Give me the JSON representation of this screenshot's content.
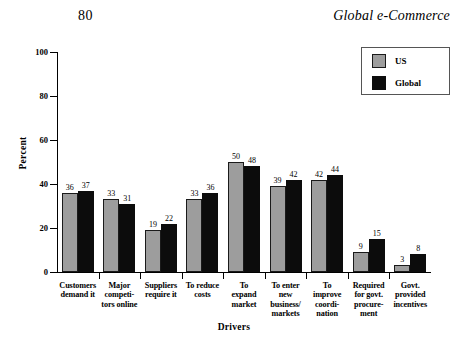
{
  "page": {
    "number": "80",
    "running_head": "Global e-Commerce"
  },
  "legend": {
    "items": [
      {
        "label": "US",
        "color": "#9d9d9d",
        "swatch": "us-swatch"
      },
      {
        "label": "Global",
        "color": "#0c0c0c",
        "swatch": "global-swatch"
      }
    ]
  },
  "chart_data": {
    "type": "bar",
    "title": "",
    "xlabel": "Drivers",
    "ylabel": "Percent",
    "ylim": [
      0,
      100
    ],
    "yticks": [
      0,
      20,
      40,
      60,
      80,
      100
    ],
    "ytick_labels": [
      "0",
      "20",
      "40",
      "60",
      "80",
      "100"
    ],
    "grid": false,
    "legend_position": "top-right",
    "categories": [
      "Customers demand it",
      "Major competi-tors online",
      "Suppliers require it",
      "To reduce costs",
      "To expand market",
      "To enter new business/ markets",
      "To improve coordi-nation",
      "Required for govt. procure-ment",
      "Govt. provided incentives"
    ],
    "category_lines": [
      [
        "Customers",
        "demand it"
      ],
      [
        "Major",
        "competi-",
        "tors online"
      ],
      [
        "Suppliers",
        "require it"
      ],
      [
        "To reduce",
        "costs"
      ],
      [
        "To",
        "expand",
        "market"
      ],
      [
        "To enter",
        "new",
        "business/",
        "markets"
      ],
      [
        "To",
        "improve",
        "coordi-",
        "nation"
      ],
      [
        "Required",
        "for govt.",
        "procure-",
        "ment"
      ],
      [
        "Govt.",
        "provided",
        "incentives"
      ]
    ],
    "series": [
      {
        "name": "US",
        "color": "#9d9d9d",
        "values": [
          36,
          33,
          19,
          33,
          50,
          39,
          42,
          9,
          3
        ]
      },
      {
        "name": "Global",
        "color": "#0c0c0c",
        "values": [
          37,
          31,
          22,
          36,
          48,
          42,
          44,
          15,
          8
        ]
      }
    ]
  }
}
